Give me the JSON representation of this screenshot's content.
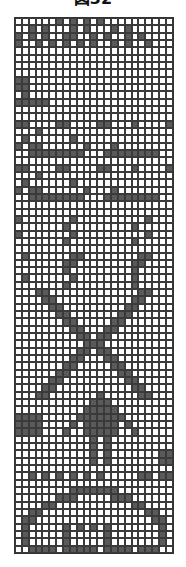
{
  "figure": {
    "title": "図32",
    "columns": 23,
    "rows_count": 73,
    "colors": {
      "on": "#5a5a5a",
      "off": "#ffffff",
      "grid_line": "#3a3a3a"
    },
    "rows": [
      "00000010101010000000000",
      "00101000101000101000000",
      "10101001100101001010000",
      "10010101010100101001000",
      "00000000000000000000000",
      "00000000000000000000000",
      "00000000000000000000000",
      "00000000000000000000000",
      "11000000000000000000000",
      "11000000000000000000000",
      "01000000000000000000000",
      "11111000000000000000000",
      "00000000000000000000000",
      "00000000000000000000000",
      "11000011000011000100001",
      "00010000000000000000000",
      "01000000100000000000000",
      "10110000001000100000000",
      "00111111110001111111100",
      "00000000000000000000000",
      "11000011000011000100001",
      "00010000000000000000000",
      "01000000100000000000000",
      "10110000001000100000000",
      "00111111110001111111100",
      "00000000000000000000000",
      "00000000000000000000000",
      "10000000100000000001000",
      "00000001000000000100000",
      "10000000100000000001000",
      "00000001000000000100000",
      "00000000000000000000000",
      "01000000110000000011000",
      "00000001100000000110000",
      "00000001000000000100000",
      "01000000100000000100000",
      "00000001000000000100000",
      "00011000000000000011000",
      "00001100000000000110000",
      "00000110000000001100000",
      "00000011000000011000000",
      "00000001100000110000000",
      "00000000110001100000000",
      "00000000011011000000000",
      "00000000001110000000000",
      "00000000011011000000000",
      "00000000110001100000000",
      "00000001100000110000000",
      "00000011000000011000000",
      "00000110000000001100000",
      "00001100000000000110000",
      "00011000000010000011000",
      "00000000000111000000000",
      "00000000001111100000000",
      "11110000011111110000000",
      "11110000101111101000000",
      "11110001001111100100000",
      "00000000000101000000000",
      "00000000000101000000000",
      "00000000000101000000011",
      "00000000000101000000011",
      "00000000000000000000000",
      "00101010101010000011011",
      "00000000000000000000000",
      "00000000111111100000000",
      "00000011100000111000000",
      "00001100000000000110000",
      "00110000000000000001100",
      "01100000000000000000110",
      "01000001010101000000010",
      "01000001000001000000010",
      "01000001000001000000010",
      "00111101111101111011100"
    ]
  }
}
